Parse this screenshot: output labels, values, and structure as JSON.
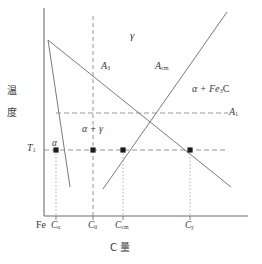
{
  "figure": {
    "axes": {
      "y_label_chars": [
        "温",
        "度"
      ],
      "y_label": "温 度",
      "x_label": "C 量",
      "origin_label": "Fe"
    },
    "phase_regions": [
      {
        "id": "gamma",
        "label": "γ"
      },
      {
        "id": "alpha-gamma",
        "label": "α + γ"
      },
      {
        "id": "alpha-fe3c",
        "label_pre": "α + Fe",
        "label_sub": "3",
        "label_post": "C"
      },
      {
        "id": "alpha",
        "label": "α"
      }
    ],
    "boundary_lines": [
      {
        "id": "a3",
        "label": "A",
        "sub": "3"
      },
      {
        "id": "acm",
        "label": "A",
        "sub": "cm"
      },
      {
        "id": "a1",
        "label": "A",
        "sub": "1"
      }
    ],
    "temperature_marker": {
      "label": "T",
      "sub": "1"
    },
    "composition_ticks": [
      {
        "id": "c-alpha",
        "label": "C",
        "sub": "α",
        "x": 56
      },
      {
        "id": "c-zero",
        "label": "C",
        "sub": "0",
        "x": 93
      },
      {
        "id": "c-cm",
        "label": "C",
        "sub": "cm",
        "x": 123
      },
      {
        "id": "c-gamma",
        "label": "C",
        "sub": "γ",
        "x": 190
      }
    ],
    "colors": {
      "line": "#6b6b6b",
      "axis": "#6b6b6b",
      "dashed": "#8a8a8a",
      "dotted": "#9a9a9a",
      "marker": "#1c1c1c",
      "text": "#3b3b3b",
      "background": "#ffffff"
    }
  }
}
